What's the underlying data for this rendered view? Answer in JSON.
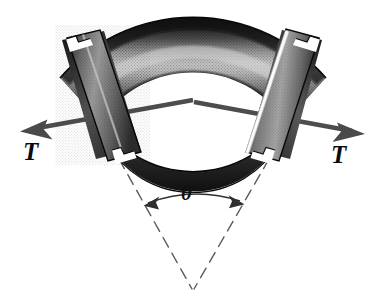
{
  "figure": {
    "kind": "engineering-diagram",
    "background_color": "#ffffff",
    "ink_color": "#0a0a0a"
  },
  "labels": {
    "force_left": "T",
    "force_right": "T",
    "angle": "θ"
  },
  "annotations": {
    "left_force_arrow": {
      "name": "tension-arrow-left",
      "direction": "down-left",
      "tail": [
        191,
        101
      ],
      "tip": [
        22,
        131
      ]
    },
    "right_force_arrow": {
      "name": "tension-arrow-right",
      "direction": "down-right",
      "tail": [
        196,
        103
      ],
      "tip": [
        364,
        134
      ]
    },
    "angle_arc": {
      "name": "bend-angle-arc",
      "arrowheads": "both",
      "left_tip": [
        145,
        206
      ],
      "right_tip": [
        243,
        204
      ]
    },
    "dashed_radii": {
      "name": "radius-construction-lines",
      "style": "dashed",
      "apex": [
        193,
        290
      ],
      "left_start": [
        120,
        160
      ],
      "right_start": [
        268,
        160
      ]
    }
  },
  "colors": {
    "pipe_dark": "#2b2b2b",
    "pipe_mid": "#6f6f6f",
    "pipe_light": "#c9c9c9",
    "pipe_highlight": "#f2f2f2",
    "flange_dark": "#1f1f1f",
    "arrow": "#4a4a4a",
    "dashed_line": "#5a5a5a",
    "arc_line": "#3a3a3a"
  },
  "geometry": {
    "bend_angle_degrees": 60,
    "outer_radius": 172,
    "inner_radius": 104,
    "center": [
      193,
      290
    ]
  }
}
